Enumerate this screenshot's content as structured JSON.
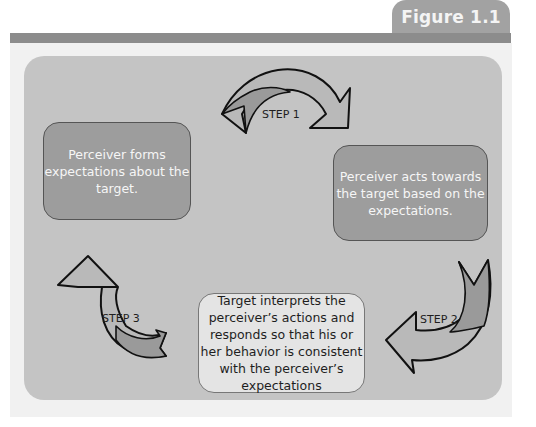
{
  "figure": {
    "label": "Figure 1.1"
  },
  "diagram": {
    "type": "cycle",
    "steps": [
      {
        "label": "STEP 1"
      },
      {
        "label": "STEP 2"
      },
      {
        "label": "STEP 3"
      }
    ],
    "boxes": [
      {
        "text": "Perceiver forms expectations about the target."
      },
      {
        "text": "Perceiver acts towards the target based on the expectations."
      },
      {
        "text": "Target interprets the perceiver’s actions and responds so that his or her behavior is consistent with the perceiver’s expectations"
      }
    ]
  },
  "colors": {
    "tab": "#a2a2a2",
    "header_bar": "#8c8c8c",
    "panel": "#c4c4c4",
    "dark_box": "#9d9d9d",
    "light_box": "#e4e4e4",
    "arrow_light": "#b9b9b9",
    "arrow_dark": "#9a9a9a"
  }
}
